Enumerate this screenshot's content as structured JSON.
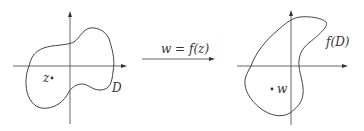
{
  "diagram": {
    "left_plane": {
      "region_label": "D",
      "point_label": "z"
    },
    "mapping": {
      "label_lhs": "w",
      "label_eq": " = ",
      "label_rhs_f": "f",
      "label_rhs_arg": "(z)"
    },
    "right_plane": {
      "region_label_f": "f",
      "region_label_arg": "(D)",
      "point_label": "w"
    },
    "colors": {
      "stroke": "#444444",
      "background": "#ffffff"
    }
  }
}
